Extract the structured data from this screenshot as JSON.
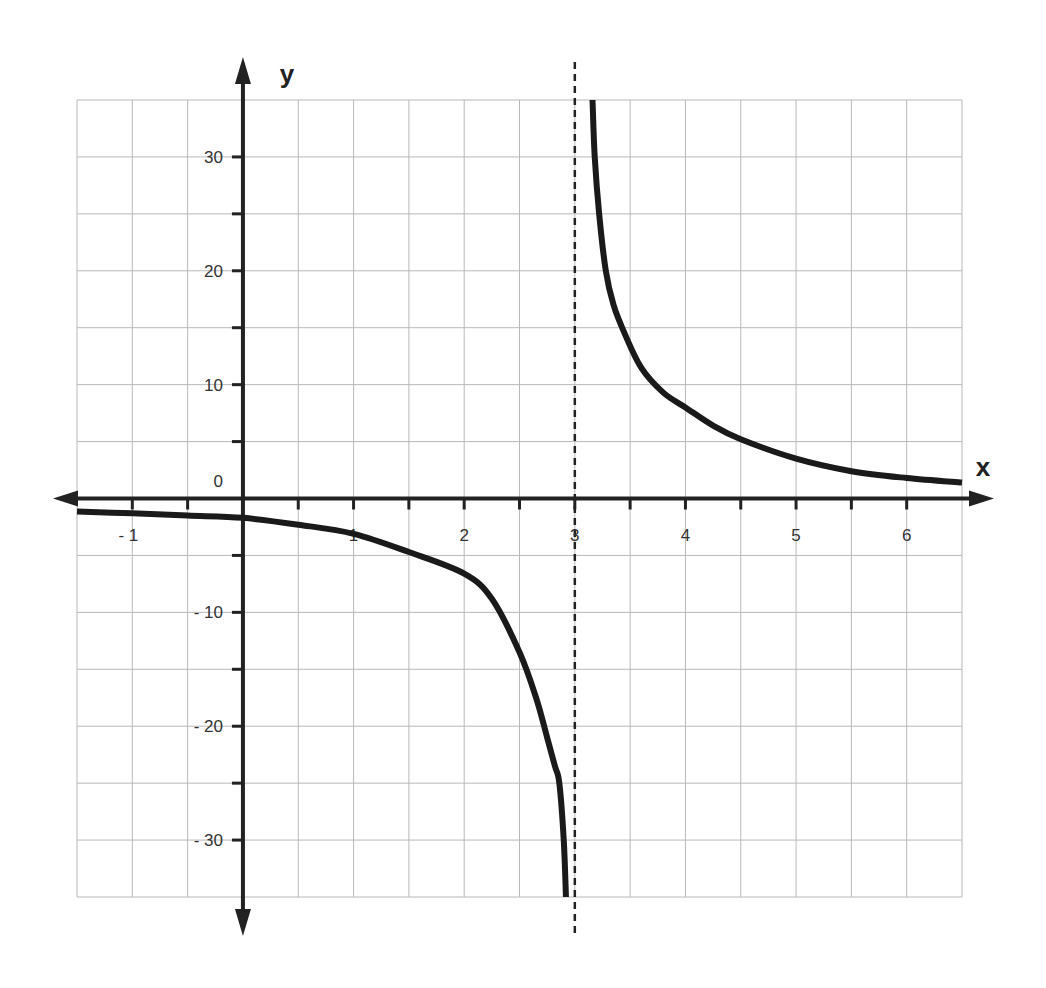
{
  "chart_data": {
    "type": "line",
    "title": "",
    "xlabel": "x",
    "ylabel": "y",
    "xlim": [
      -1.5,
      6.5
    ],
    "ylim": [
      -35,
      35
    ],
    "grid": true,
    "x_grid_step": 0.5,
    "y_grid_step": 5,
    "x_ticks": [
      {
        "value": -1,
        "label": "- 1"
      },
      {
        "value": 1,
        "label": "1"
      },
      {
        "value": 2,
        "label": "2"
      },
      {
        "value": 3,
        "label": "3"
      },
      {
        "value": 4,
        "label": "4"
      },
      {
        "value": 5,
        "label": "5"
      },
      {
        "value": 6,
        "label": "6"
      }
    ],
    "y_ticks": [
      {
        "value": 30,
        "label": "30"
      },
      {
        "value": 20,
        "label": "20"
      },
      {
        "value": 10,
        "label": "10"
      },
      {
        "value": 0,
        "label": "0"
      },
      {
        "value": -10,
        "label": "- 10"
      },
      {
        "value": -20,
        "label": "- 20"
      },
      {
        "value": -30,
        "label": "- 30"
      }
    ],
    "vertical_asymptote": {
      "x": 3,
      "style": "dashed"
    },
    "horizontal_asymptote": {
      "y": 0
    },
    "series": [
      {
        "name": "left-branch",
        "x": [
          -1.5,
          -1,
          -0.5,
          0,
          0.5,
          1,
          1.5,
          2,
          2.25,
          2.5,
          2.65,
          2.75,
          2.82,
          2.86,
          2.9,
          2.92
        ],
        "y": [
          -1.15,
          -1.3,
          -1.5,
          -1.7,
          -2.3,
          -3.1,
          -4.7,
          -6.6,
          -8.8,
          -13.5,
          -17.5,
          -21,
          -23.5,
          -25,
          -30,
          -35
        ]
      },
      {
        "name": "right-branch",
        "x": [
          3.16,
          3.18,
          3.22,
          3.28,
          3.35,
          3.45,
          3.6,
          3.8,
          4,
          4.25,
          4.5,
          5,
          5.5,
          6,
          6.5
        ],
        "y": [
          35,
          30,
          25,
          20,
          17,
          14.5,
          11.5,
          9.3,
          8,
          6.4,
          5.2,
          3.5,
          2.4,
          1.8,
          1.4
        ]
      }
    ]
  }
}
